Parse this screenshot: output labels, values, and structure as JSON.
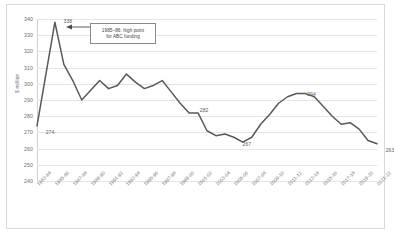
{
  "chart_data": {
    "type": "line",
    "title": "",
    "xlabel": "",
    "ylabel": "$ million",
    "ylim": [
      240,
      340
    ],
    "ytick_step": 10,
    "grid": true,
    "legend": "none",
    "line_color": "#595959",
    "categories": [
      "1983-84",
      "1984-85",
      "1985-86",
      "1986-87",
      "1987-88",
      "1988-89",
      "1989-90",
      "1990-91",
      "1991-92",
      "1992-93",
      "1993-94",
      "1994-95",
      "1995-96",
      "1996-97",
      "1997-98",
      "1998-99",
      "1999-00",
      "2000-01",
      "2001-02",
      "2002-03",
      "2003-04",
      "2004-05",
      "2005-06",
      "2006-07",
      "2007-08",
      "2008-09",
      "2009-10",
      "2010-11",
      "2011-12",
      "2012-13",
      "2013-14",
      "2014-15",
      "2015-16",
      "2016-17",
      "2017-18",
      "2018-19",
      "2019-20",
      "2020-21",
      "2021-22"
    ],
    "xtick_labels": [
      "1983-84",
      "1985-86",
      "1987-88",
      "1989-90",
      "1991-92",
      "1993-94",
      "1995-96",
      "1997-98",
      "1999-00",
      "2001-02",
      "2003-04",
      "2005-06",
      "2007-08",
      "2009-10",
      "2011-12",
      "2013-14",
      "2015-16",
      "2017-18",
      "2019-20",
      "2021-22"
    ],
    "values": [
      274,
      306,
      338,
      312,
      302,
      290,
      296,
      302,
      297,
      299,
      306,
      301,
      297,
      299,
      302,
      295,
      288,
      282,
      282,
      271,
      268,
      269,
      267,
      264,
      267,
      275,
      281,
      288,
      292,
      294,
      294,
      292,
      286,
      280,
      275,
      276,
      272,
      265,
      263
    ],
    "point_labels": [
      {
        "index": 0,
        "text": "274"
      },
      {
        "index": 2,
        "text": "338"
      },
      {
        "index": 17,
        "text": "282"
      },
      {
        "index": 22,
        "text": "267"
      },
      {
        "index": 29,
        "text": "294"
      },
      {
        "index": 38,
        "text": "263"
      }
    ],
    "annotations": [
      {
        "name": "high-point-callout",
        "line1": "1985–86: high point",
        "line2": "for ABC funding"
      }
    ]
  }
}
